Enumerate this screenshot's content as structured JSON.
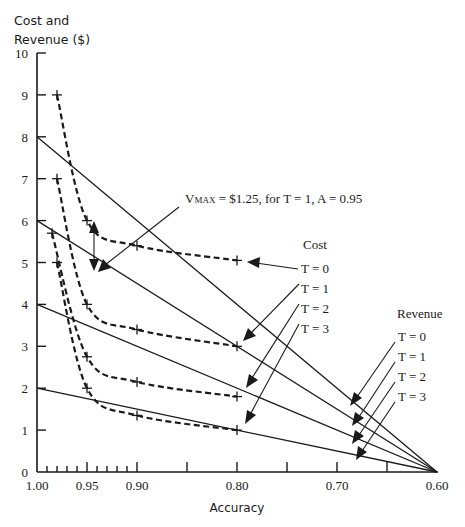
{
  "chart_data": {
    "type": "line",
    "title": "",
    "ylabel_line1": "Cost and",
    "ylabel_line2": "Revenue ($)",
    "xlabel": "Accuracy",
    "xlim": [
      1.0,
      0.6
    ],
    "ylim": [
      0,
      10
    ],
    "grid": false,
    "y_ticks": [
      "0",
      "1",
      "2",
      "3",
      "4",
      "5",
      "6",
      "7",
      "8",
      "9",
      "10"
    ],
    "x_tick_labels": [
      {
        "value": 1.0,
        "label": "1.00"
      },
      {
        "value": 0.95,
        "label": "0.95"
      },
      {
        "value": 0.9,
        "label": "0.90"
      },
      {
        "value": 0.8,
        "label": "0.80"
      },
      {
        "value": 0.7,
        "label": "0.70"
      },
      {
        "value": 0.6,
        "label": "0.60"
      }
    ],
    "x_major_ticks": [
      0.95,
      0.9,
      0.85,
      0.8,
      0.75,
      0.7,
      0.65
    ],
    "x_minor_ticks": [
      0.99,
      0.98,
      0.97,
      0.96,
      0.94,
      0.93,
      0.92,
      0.91
    ],
    "series": [
      {
        "name": "Revenue T = 0",
        "group": "Revenue",
        "style": "solid",
        "x": [
          1.0,
          0.6
        ],
        "y": [
          8,
          0
        ]
      },
      {
        "name": "Revenue T = 1",
        "group": "Revenue",
        "style": "solid",
        "x": [
          1.0,
          0.6
        ],
        "y": [
          6,
          0
        ]
      },
      {
        "name": "Revenue T = 2",
        "group": "Revenue",
        "style": "solid",
        "x": [
          1.0,
          0.6
        ],
        "y": [
          4,
          0
        ]
      },
      {
        "name": "Revenue T = 3",
        "group": "Revenue",
        "style": "solid",
        "x": [
          1.0,
          0.6
        ],
        "y": [
          2,
          0
        ]
      },
      {
        "name": "Cost T = 0",
        "group": "Cost",
        "style": "dashed",
        "x": [
          0.98,
          0.95,
          0.9,
          0.8
        ],
        "y": [
          9.0,
          6.0,
          5.4,
          5.05
        ]
      },
      {
        "name": "Cost T = 1",
        "group": "Cost",
        "style": "dashed",
        "x": [
          0.98,
          0.95,
          0.9,
          0.8
        ],
        "y": [
          7.0,
          4.0,
          3.4,
          3.0
        ]
      },
      {
        "name": "Cost T = 2",
        "group": "Cost",
        "style": "dashed",
        "x": [
          0.985,
          0.95,
          0.9,
          0.8
        ],
        "y": [
          5.7,
          2.75,
          2.15,
          1.8
        ]
      },
      {
        "name": "Cost T = 3",
        "group": "Cost",
        "style": "dashed",
        "x": [
          0.98,
          0.95,
          0.9,
          0.8
        ],
        "y": [
          5.0,
          2.0,
          1.35,
          1.0
        ]
      }
    ],
    "annotations": {
      "vmax_prefix": "V",
      "vmax_sub": "MAX",
      "vmax_rest": " = $1.25, for T = 1, A = 0.95",
      "cost_legend_title": "Cost",
      "revenue_legend_title": "Revenue",
      "cost_labels": [
        "T = 0",
        "T = 1",
        "T = 2",
        "T = 3"
      ],
      "revenue_labels": [
        "T = 0",
        "T = 1",
        "T = 2",
        "T = 3"
      ]
    }
  }
}
